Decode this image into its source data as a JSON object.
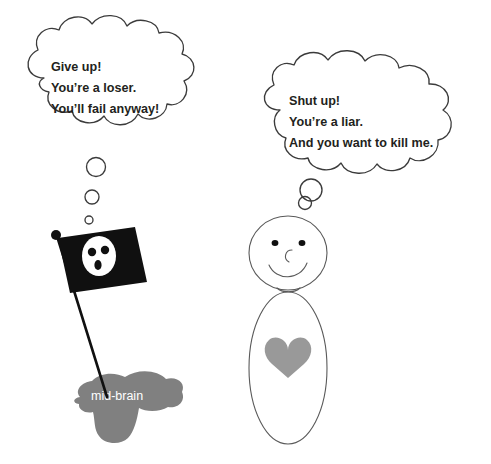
{
  "illustration": {
    "title": "mid-brain inner critic versus self dialogue",
    "background_color": "#ffffff",
    "ink_color": "#3b3b3b",
    "blob_color": "#808080",
    "heart_color": "#999999",
    "flag_color": "#101010",
    "label_text_color": "#ffffff",
    "bubble_text_color": "#231f20"
  },
  "left_thought_bubble": {
    "name": "mid-brain-thought-bubble",
    "lines": [
      "Give up!",
      "You’re a loser.",
      "You’ll fail anyway!"
    ],
    "tail_circle_count": 3
  },
  "right_thought_bubble": {
    "name": "person-thought-bubble",
    "lines": [
      "Shut up!",
      "You’re a liar.",
      "And you want to kill me."
    ],
    "tail_circle_count": 2
  },
  "left_figure": {
    "blob_label": "mid-brain",
    "flag": {
      "name": "skull-flag",
      "fill": "#101010",
      "emblem": "skull-icon",
      "pole_finial": "ball"
    }
  },
  "right_figure": {
    "name": "stick-person",
    "face": {
      "expression": "smiling",
      "eye_count": 2,
      "has_nose": true,
      "has_smile": true
    },
    "body": {
      "shape": "oval",
      "emblem": "heart-icon",
      "emblem_color": "#999999"
    }
  }
}
